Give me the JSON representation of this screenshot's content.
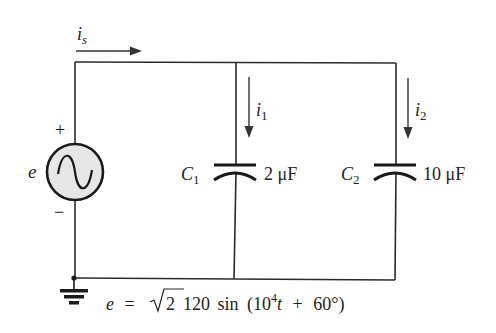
{
  "diagram": {
    "type": "AC parallel capacitor circuit",
    "source": {
      "symbol": "ac-voltage-source",
      "label": "e",
      "plus": "+",
      "minus": "−"
    },
    "source_current": {
      "label": "i",
      "subscript": "s"
    },
    "branches": [
      {
        "current": {
          "label": "i",
          "subscript": "1"
        },
        "component": {
          "name": "C",
          "subscript": "1",
          "value": "2 μF"
        }
      },
      {
        "current": {
          "label": "i",
          "subscript": "2"
        },
        "component": {
          "name": "C",
          "subscript": "2",
          "value": "10 μF"
        }
      }
    ],
    "ground": "ground-symbol",
    "equation": {
      "lhs": "e",
      "eq": "=",
      "sqrt_arg": "2",
      "amplitude": "120",
      "func": "sin",
      "open": "(",
      "base": "10",
      "exp": "4",
      "var": "t",
      "plus": "+",
      "phase": "60°",
      "close": ")"
    },
    "colors": {
      "wire": "#2a2a2a",
      "source_fill": "#e6e6e6",
      "background": "#ffffff"
    }
  }
}
